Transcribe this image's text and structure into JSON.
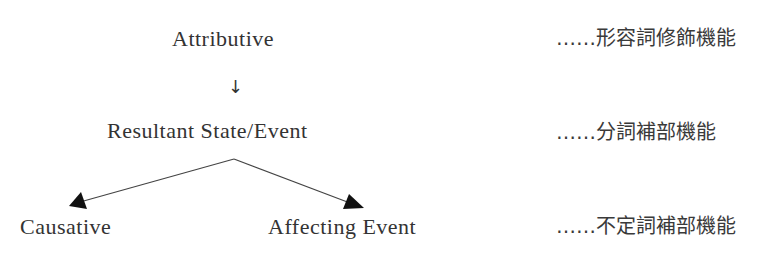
{
  "diagram": {
    "nodes": {
      "attributive": "Attributive",
      "resultant": "Resultant State/Event",
      "causative": "Causative",
      "affecting": "Affecting Event"
    },
    "arrow_symbol": "↓",
    "functions": {
      "row1": "……形容詞修飾機能",
      "row2": "……分詞補部機能",
      "row3": "……不定詞補部機能"
    },
    "edges": [
      {
        "from": "Attributive",
        "to": "Resultant State/Event"
      },
      {
        "from": "Resultant State/Event",
        "to": "Causative"
      },
      {
        "from": "Resultant State/Event",
        "to": "Affecting Event"
      }
    ],
    "colors": {
      "text": "#333333",
      "line": "#444444",
      "arrowhead": "#111111"
    }
  }
}
